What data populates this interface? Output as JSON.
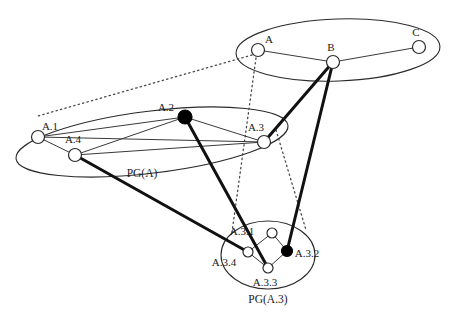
{
  "diagram": {
    "canvas": {
      "width": 458,
      "height": 324
    },
    "colors": {
      "stroke": "#2b2b2b",
      "thick_edge": "#111111",
      "thin_edge": "#3a3a3a",
      "dotted_edge": "#4a4a4a",
      "node_fill_open": "#ffffff",
      "node_fill_solid": "#000000",
      "background": "#ffffff",
      "text": "#1a1a1a"
    },
    "clusters": [
      {
        "id": "top",
        "label": "",
        "label_x": 0,
        "label_y": 0,
        "cx": 338,
        "cy": 50,
        "rx": 102,
        "ry": 31,
        "rotate": -2
      },
      {
        "id": "pga",
        "label": "PG(A)",
        "label_x": 142,
        "label_y": 177,
        "cx": 152,
        "cy": 142,
        "rx": 137,
        "ry": 31,
        "rotate": -7
      },
      {
        "id": "pga3",
        "label": "PG(A.3)",
        "label_x": 268,
        "label_y": 303,
        "cx": 268,
        "cy": 255,
        "rx": 47,
        "ry": 34,
        "rotate": 0
      }
    ],
    "nodes": [
      {
        "id": "A",
        "label": "A",
        "x": 258,
        "y": 50,
        "r": 6.5,
        "filled": false,
        "label_dx": 11,
        "label_dy": -7
      },
      {
        "id": "B",
        "label": "B",
        "x": 333,
        "y": 62,
        "r": 6.5,
        "filled": false,
        "label_dx": -2,
        "label_dy": -11
      },
      {
        "id": "C",
        "label": "C",
        "x": 419,
        "y": 47,
        "r": 6.5,
        "filled": false,
        "label_dx": -3,
        "label_dy": -11
      },
      {
        "id": "A.1",
        "label": "A.1",
        "x": 38,
        "y": 137,
        "r": 6.5,
        "filled": false,
        "label_dx": 12,
        "label_dy": -7
      },
      {
        "id": "A.2",
        "label": "A.2",
        "x": 185,
        "y": 117,
        "r": 7.0,
        "filled": true,
        "label_dx": -19,
        "label_dy": -6
      },
      {
        "id": "A.3",
        "label": "A.3",
        "x": 264,
        "y": 142,
        "r": 6.5,
        "filled": false,
        "label_dx": -8,
        "label_dy": -11
      },
      {
        "id": "A.4",
        "label": "A.4",
        "x": 75,
        "y": 155,
        "r": 6.5,
        "filled": false,
        "label_dx": -2,
        "label_dy": -12
      },
      {
        "id": "A.3.1",
        "label": "A.3.1",
        "x": 272,
        "y": 233,
        "r": 5.0,
        "filled": false,
        "label_dx": -30,
        "label_dy": 2
      },
      {
        "id": "A.3.4",
        "label": "A.3.4",
        "x": 248,
        "y": 252,
        "r": 5.0,
        "filled": false,
        "label_dx": -24,
        "label_dy": 14
      },
      {
        "id": "A.3.3",
        "label": "A.3.3",
        "x": 268,
        "y": 268,
        "r": 5.0,
        "filled": false,
        "label_dx": -3,
        "label_dy": 18
      },
      {
        "id": "A.3.2",
        "label": "A.3.2",
        "x": 287,
        "y": 251,
        "r": 5.5,
        "filled": true,
        "label_dx": 20,
        "label_dy": 6
      }
    ],
    "edges_thin": [
      {
        "from": "A",
        "to": "B"
      },
      {
        "from": "B",
        "to": "C"
      },
      {
        "from": "A.1",
        "to": "A.4"
      },
      {
        "from": "A.1",
        "to": "A.2"
      },
      {
        "from": "A.1",
        "to": "A.3"
      },
      {
        "from": "A.4",
        "to": "A.2"
      },
      {
        "from": "A.4",
        "to": "A.3"
      },
      {
        "from": "A.2",
        "to": "A.3"
      },
      {
        "from": "A.3.1",
        "to": "A.3.4"
      },
      {
        "from": "A.3.1",
        "to": "A.3.2"
      },
      {
        "from": "A.3.4",
        "to": "A.3.3"
      },
      {
        "from": "A.3.3",
        "to": "A.3.2"
      }
    ],
    "edges_thick": [
      {
        "from": "B",
        "to": "A.3"
      },
      {
        "from": "B",
        "to": "A.3.2"
      },
      {
        "from": "A.4",
        "to": "A.3.4"
      },
      {
        "from": "A.2",
        "to": "A.3.3"
      }
    ],
    "edges_dotted": [
      {
        "from": "A",
        "to": "pga-boundary",
        "x1": 252,
        "y1": 55,
        "x2": 38,
        "y2": 116
      },
      {
        "from": "A",
        "to": "pga3-boundary",
        "x1": 256,
        "y1": 58,
        "x2": 232,
        "y2": 232
      },
      {
        "from": "A.3",
        "to": "pga3-right",
        "x1": 276,
        "y1": 130,
        "x2": 306,
        "y2": 230
      }
    ]
  }
}
